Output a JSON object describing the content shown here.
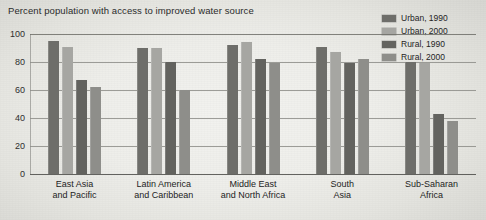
{
  "chart_data": {
    "type": "bar",
    "title": "Percent population with access to improved water source",
    "xlabel": "",
    "ylabel": "",
    "ylim": [
      0,
      100
    ],
    "yticks": [
      100,
      80,
      60,
      40,
      20,
      0
    ],
    "grid": true,
    "legend_position": "top-right",
    "categories": [
      "East Asia\nand Pacific",
      "Latin America\nand Caribbean",
      "Middle East\nand North Africa",
      "South\nAsia",
      "Sub-Saharan\nAfrica"
    ],
    "category_lines": [
      [
        "East Asia",
        "and Pacific"
      ],
      [
        "Latin America",
        "and Caribbean"
      ],
      [
        "Middle East",
        "and North Africa"
      ],
      [
        "South",
        "Asia"
      ],
      [
        "Sub-Saharan",
        "Africa"
      ]
    ],
    "series": [
      {
        "name": "Urban, 1990",
        "color": "#6e6e6a",
        "values": [
          95,
          90,
          92,
          91,
          80
        ]
      },
      {
        "name": "Urban, 2000",
        "color": "#a6a6a2",
        "values": [
          91,
          90,
          94,
          87,
          79
        ]
      },
      {
        "name": "Rural, 1990",
        "color": "#63635f",
        "values": [
          67,
          80,
          82,
          79,
          43
        ]
      },
      {
        "name": "Rural, 2000",
        "color": "#8e8e8a",
        "values": [
          62,
          60,
          79,
          82,
          38
        ]
      }
    ]
  }
}
